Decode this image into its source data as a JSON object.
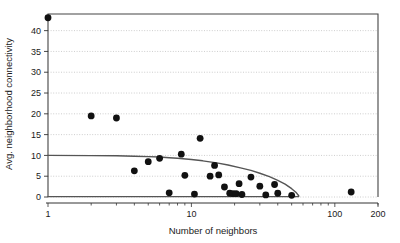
{
  "chart_data": {
    "type": "scatter",
    "title": "",
    "xlabel": "Number of neighbors",
    "ylabel": "Avg. neighborhood connectivity",
    "xscale": "log",
    "yscale": "linear",
    "xlim": [
      1,
      200
    ],
    "ylim": [
      0,
      44
    ],
    "grid": true,
    "legend": null,
    "xticks": [
      1,
      10,
      100,
      200
    ],
    "xtick_labels": [
      "1",
      "10",
      "100",
      "200"
    ],
    "yticks": [
      0,
      5,
      10,
      15,
      20,
      25,
      30,
      35,
      40
    ],
    "ytick_labels": [
      "0",
      "5",
      "10",
      "15",
      "20",
      "25",
      "30",
      "35",
      "40"
    ],
    "marker_color": "#111111",
    "line_color": "#555555",
    "grid_color": "#b8b8b8",
    "axis_color": "#444444",
    "points": [
      {
        "x": 1.0,
        "y": 43.1
      },
      {
        "x": 2.0,
        "y": 19.5
      },
      {
        "x": 3.0,
        "y": 19.0
      },
      {
        "x": 4.0,
        "y": 6.3
      },
      {
        "x": 5.0,
        "y": 8.5
      },
      {
        "x": 6.0,
        "y": 9.3
      },
      {
        "x": 7.0,
        "y": 1.0
      },
      {
        "x": 8.5,
        "y": 10.3
      },
      {
        "x": 9.0,
        "y": 5.2
      },
      {
        "x": 10.5,
        "y": 0.7
      },
      {
        "x": 11.5,
        "y": 14.1
      },
      {
        "x": 13.5,
        "y": 5.0
      },
      {
        "x": 14.5,
        "y": 7.6
      },
      {
        "x": 15.5,
        "y": 5.3
      },
      {
        "x": 17.0,
        "y": 2.4
      },
      {
        "x": 18.5,
        "y": 0.9
      },
      {
        "x": 19.5,
        "y": 0.8
      },
      {
        "x": 20.5,
        "y": 0.8
      },
      {
        "x": 21.5,
        "y": 3.2
      },
      {
        "x": 22.5,
        "y": 0.6
      },
      {
        "x": 26.0,
        "y": 4.8
      },
      {
        "x": 30.0,
        "y": 2.6
      },
      {
        "x": 33.0,
        "y": 0.5
      },
      {
        "x": 38.0,
        "y": 3.0
      },
      {
        "x": 40.0,
        "y": 0.9
      },
      {
        "x": 50.0,
        "y": 0.4
      },
      {
        "x": 130.0,
        "y": 1.2
      }
    ],
    "trend_line": {
      "name": "fitted-curve",
      "points": [
        {
          "x": 1.0,
          "y": 10.0
        },
        {
          "x": 2.0,
          "y": 9.95
        },
        {
          "x": 3.0,
          "y": 9.9
        },
        {
          "x": 4.0,
          "y": 9.8
        },
        {
          "x": 5.0,
          "y": 9.7
        },
        {
          "x": 6.0,
          "y": 9.6
        },
        {
          "x": 7.0,
          "y": 9.45
        },
        {
          "x": 8.0,
          "y": 9.3
        },
        {
          "x": 10.0,
          "y": 9.0
        },
        {
          "x": 12.0,
          "y": 8.7
        },
        {
          "x": 15.0,
          "y": 8.2
        },
        {
          "x": 18.0,
          "y": 7.7
        },
        {
          "x": 22.0,
          "y": 7.0
        },
        {
          "x": 26.0,
          "y": 6.4
        },
        {
          "x": 30.0,
          "y": 5.7
        },
        {
          "x": 35.0,
          "y": 4.9
        },
        {
          "x": 40.0,
          "y": 4.0
        },
        {
          "x": 45.0,
          "y": 3.1
        },
        {
          "x": 50.0,
          "y": 2.0
        },
        {
          "x": 54.0,
          "y": 1.0
        },
        {
          "x": 56.0,
          "y": 0.3
        }
      ]
    },
    "baseline": {
      "name": "zero-baseline",
      "y": 0.1,
      "x_start": 1.0,
      "x_end": 56.0
    }
  }
}
